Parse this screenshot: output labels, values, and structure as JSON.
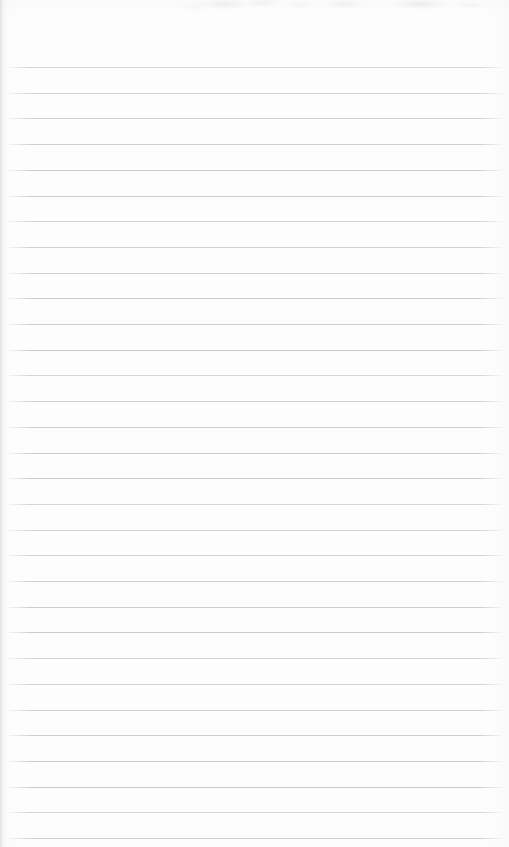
{
  "document": {
    "kind": "scanned-lined-paper",
    "title": "Blank ruled notepad page",
    "description": "A scanned blank sheet of ruled (lined) notepad paper with no handwriting or printed text.",
    "body_text": "",
    "page_width": 509,
    "page_height": 847,
    "paper_color": "#fdfdfd",
    "rule_color": "#c9cbce",
    "rule_thickness_px": 1,
    "rule_spacing_px": 25.7,
    "first_rule_y": 67,
    "rule_count": 31,
    "rule_left_x": 5,
    "rule_right_x": 505,
    "top_margin_px": 67,
    "has_vertical_margin_rule": false,
    "artifacts": {
      "top_edge_scan_noise": true,
      "left_edge_shadow": true
    }
  }
}
